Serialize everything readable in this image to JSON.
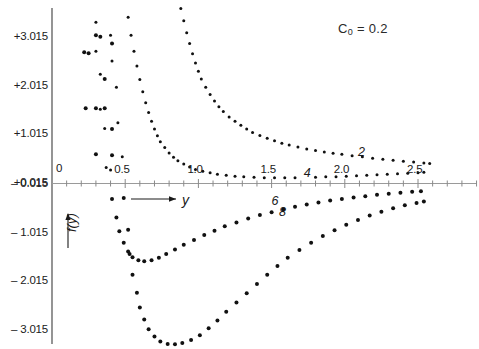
{
  "title": {
    "text_html": "C<sub>0</sub> = 0.2",
    "text": "C0 = 0.2"
  },
  "axes": {
    "x_axis_name": "y",
    "y_axis_name": "f(y)",
    "origin_label": "0",
    "x_ticks_labeled": [
      {
        "value": 0.5,
        "label": "0.5"
      },
      {
        "value": 1.0,
        "label": "1.0"
      },
      {
        "value": 1.5,
        "label": "1.5"
      },
      {
        "value": 2.0,
        "label": "2.0"
      },
      {
        "value": 2.5,
        "label": "2.5"
      }
    ],
    "x_minor_tick_step": 0.1,
    "x_minor_tick_end": 3.0,
    "y_ticks_labeled": [
      {
        "value": 3.015,
        "label": "+3.015"
      },
      {
        "value": 2.015,
        "label": "+2.015"
      },
      {
        "value": 1.015,
        "label": "+1.015"
      },
      {
        "value": 0.015,
        "label": "+0.015"
      },
      {
        "value": -0.015,
        "label": "– 0.015"
      },
      {
        "value": -1.015,
        "label": "– 1.015"
      },
      {
        "value": -2.015,
        "label": "– 2.015"
      },
      {
        "value": -3.015,
        "label": "– 3.015"
      }
    ]
  },
  "chart_data": {
    "type": "scatter",
    "title": "C0 = 0.2",
    "xlabel": "y",
    "ylabel": "f(y)",
    "xlim": [
      0,
      3.0
    ],
    "ylim": [
      -3.6,
      3.6
    ],
    "grid": false,
    "legend": "inline curve labels",
    "marker": "dot",
    "series": [
      {
        "name": "2",
        "label": "2",
        "label_at": {
          "x": 2.09,
          "y": 0.62
        },
        "points": [
          [
            0.88,
            3.6
          ],
          [
            0.9,
            3.35
          ],
          [
            0.92,
            3.1
          ],
          [
            0.94,
            2.88
          ],
          [
            0.96,
            2.67
          ],
          [
            0.98,
            2.48
          ],
          [
            1.0,
            2.31
          ],
          [
            1.02,
            2.15
          ],
          [
            1.05,
            1.98
          ],
          [
            1.08,
            1.83
          ],
          [
            1.11,
            1.7
          ],
          [
            1.14,
            1.58
          ],
          [
            1.17,
            1.48
          ],
          [
            1.21,
            1.37
          ],
          [
            1.25,
            1.28
          ],
          [
            1.29,
            1.2
          ],
          [
            1.33,
            1.12
          ],
          [
            1.37,
            1.05
          ],
          [
            1.42,
            0.99
          ],
          [
            1.47,
            0.93
          ],
          [
            1.52,
            0.88
          ],
          [
            1.57,
            0.83
          ],
          [
            1.62,
            0.79
          ],
          [
            1.68,
            0.75
          ],
          [
            1.74,
            0.71
          ],
          [
            1.8,
            0.68
          ],
          [
            1.86,
            0.65
          ],
          [
            1.92,
            0.62
          ],
          [
            1.98,
            0.6
          ],
          [
            2.05,
            0.57
          ],
          [
            2.12,
            0.55
          ],
          [
            2.19,
            0.52
          ],
          [
            2.26,
            0.5
          ],
          [
            2.33,
            0.48
          ],
          [
            2.4,
            0.46
          ],
          [
            2.47,
            0.44
          ],
          [
            2.54,
            0.42
          ],
          [
            2.58,
            0.41
          ]
        ]
      },
      {
        "name": "4",
        "label": "4",
        "label_at": {
          "x": 1.72,
          "y": 0.2
        },
        "points": [
          [
            0.52,
            3.42
          ],
          [
            0.54,
            3.05
          ],
          [
            0.56,
            2.72
          ],
          [
            0.58,
            2.42
          ],
          [
            0.6,
            2.14
          ],
          [
            0.62,
            1.89
          ],
          [
            0.64,
            1.66
          ],
          [
            0.66,
            1.46
          ],
          [
            0.68,
            1.28
          ],
          [
            0.7,
            1.12
          ],
          [
            0.72,
            0.98
          ],
          [
            0.74,
            0.86
          ],
          [
            0.77,
            0.74
          ],
          [
            0.8,
            0.63
          ],
          [
            0.83,
            0.54
          ],
          [
            0.86,
            0.47
          ],
          [
            0.9,
            0.4
          ],
          [
            0.94,
            0.34
          ],
          [
            0.98,
            0.29
          ],
          [
            1.03,
            0.25
          ],
          [
            1.08,
            0.22
          ],
          [
            1.13,
            0.19
          ],
          [
            1.19,
            0.17
          ],
          [
            1.25,
            0.15
          ],
          [
            1.31,
            0.14
          ],
          [
            1.38,
            0.13
          ],
          [
            1.45,
            0.12
          ],
          [
            1.52,
            0.12
          ],
          [
            1.59,
            0.12
          ],
          [
            1.66,
            0.12
          ],
          [
            1.8,
            0.13
          ],
          [
            1.87,
            0.14
          ],
          [
            1.94,
            0.14
          ],
          [
            2.01,
            0.15
          ],
          [
            2.08,
            0.16
          ],
          [
            2.15,
            0.17
          ],
          [
            2.22,
            0.18
          ],
          [
            2.29,
            0.19
          ],
          [
            2.36,
            0.2
          ],
          [
            2.43,
            0.21
          ],
          [
            2.5,
            0.22
          ],
          [
            2.54,
            0.23
          ]
        ]
      },
      {
        "name": "6",
        "label": "6",
        "label_at": {
          "x": 1.5,
          "y": -0.38
        },
        "points": [
          [
            0.3,
            3.32
          ],
          [
            0.3,
            2.72
          ],
          [
            0.33,
            2.25
          ],
          [
            0.33,
            1.53
          ],
          [
            0.36,
            1.13
          ],
          [
            0.37,
            0.33
          ],
          [
            0.4,
            0.28
          ],
          [
            0.41,
            -0.32
          ],
          [
            0.44,
            -0.7
          ],
          [
            0.46,
            -0.98
          ],
          [
            0.49,
            -1.22
          ],
          [
            0.52,
            -1.4
          ],
          [
            0.55,
            -1.52
          ],
          [
            0.59,
            -1.58
          ],
          [
            0.63,
            -1.6
          ],
          [
            0.68,
            -1.58
          ],
          [
            0.73,
            -1.53
          ],
          [
            0.78,
            -1.45
          ],
          [
            0.84,
            -1.36
          ],
          [
            0.9,
            -1.26
          ],
          [
            0.97,
            -1.16
          ],
          [
            1.04,
            -1.06
          ],
          [
            1.11,
            -0.97
          ],
          [
            1.18,
            -0.88
          ],
          [
            1.26,
            -0.8
          ],
          [
            1.34,
            -0.72
          ],
          [
            1.42,
            -0.65
          ],
          [
            1.5,
            -0.59
          ],
          [
            1.58,
            -0.53
          ],
          [
            1.66,
            -0.48
          ],
          [
            1.74,
            -0.43
          ],
          [
            1.82,
            -0.39
          ],
          [
            1.9,
            -0.35
          ],
          [
            1.98,
            -0.32
          ],
          [
            2.06,
            -0.29
          ],
          [
            2.14,
            -0.26
          ],
          [
            2.22,
            -0.23
          ],
          [
            2.3,
            -0.21
          ],
          [
            2.38,
            -0.19
          ],
          [
            2.46,
            -0.17
          ],
          [
            2.52,
            -0.16
          ]
        ]
      },
      {
        "name": "8",
        "label": "8",
        "label_at": {
          "x": 1.55,
          "y": -0.6
        },
        "points": [
          [
            0.4,
            3.05
          ],
          [
            0.41,
            2.52
          ],
          [
            0.44,
            1.98
          ],
          [
            0.45,
            1.25
          ],
          [
            0.48,
            0.55
          ],
          [
            0.49,
            -0.3
          ],
          [
            0.52,
            -0.95
          ],
          [
            0.53,
            -1.45
          ],
          [
            0.55,
            -1.88
          ],
          [
            0.58,
            -2.25
          ],
          [
            0.6,
            -2.55
          ],
          [
            0.63,
            -2.8
          ],
          [
            0.66,
            -3.0
          ],
          [
            0.7,
            -3.15
          ],
          [
            0.74,
            -3.25
          ],
          [
            0.79,
            -3.3
          ],
          [
            0.84,
            -3.31
          ],
          [
            0.89,
            -3.28
          ],
          [
            0.95,
            -3.22
          ],
          [
            1.01,
            -3.12
          ],
          [
            1.07,
            -2.98
          ],
          [
            1.13,
            -2.82
          ],
          [
            1.19,
            -2.64
          ],
          [
            1.26,
            -2.45
          ],
          [
            1.33,
            -2.26
          ],
          [
            1.4,
            -2.07
          ],
          [
            1.47,
            -1.88
          ],
          [
            1.54,
            -1.7
          ],
          [
            1.61,
            -1.53
          ],
          [
            1.69,
            -1.37
          ],
          [
            1.77,
            -1.22
          ],
          [
            1.85,
            -1.08
          ],
          [
            1.93,
            -0.96
          ],
          [
            2.01,
            -0.85
          ],
          [
            2.09,
            -0.75
          ],
          [
            2.17,
            -0.66
          ],
          [
            2.25,
            -0.58
          ],
          [
            2.33,
            -0.51
          ],
          [
            2.41,
            -0.45
          ],
          [
            2.49,
            -0.4
          ],
          [
            2.54,
            -0.37
          ]
        ]
      },
      {
        "name": "sparse-upper",
        "label": "",
        "label_at": null,
        "points": [
          [
            0.3,
            0.6
          ],
          [
            0.41,
            0.58
          ],
          [
            0.3,
            1.55
          ],
          [
            0.41,
            1.12
          ],
          [
            0.23,
            1.55
          ],
          [
            0.36,
            1.55
          ],
          [
            0.25,
            2.68
          ],
          [
            0.36,
            2.15
          ],
          [
            0.22,
            2.7
          ],
          [
            0.33,
            3.02
          ],
          [
            0.3,
            3.05
          ],
          [
            0.41,
            2.88
          ]
        ]
      }
    ]
  }
}
